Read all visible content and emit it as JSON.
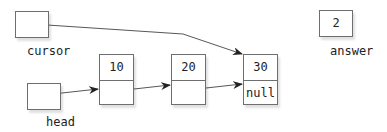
{
  "variables": {
    "cursor": {
      "label": "cursor",
      "value": ""
    },
    "head": {
      "label": "head",
      "value": ""
    },
    "answer": {
      "label": "answer",
      "value": "2"
    }
  },
  "nodes": [
    {
      "data": "10",
      "next": ""
    },
    {
      "data": "20",
      "next": ""
    },
    {
      "data": "30",
      "next": "null"
    }
  ],
  "colors": {
    "stroke": "#6e6e6e",
    "arrow": "#333333"
  }
}
